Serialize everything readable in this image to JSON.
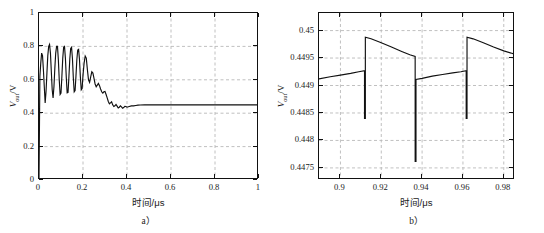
{
  "figure": {
    "panels": [
      {
        "id": "a",
        "caption": "a）",
        "axis_title_x": "时间/μs",
        "axis_title_y_main": "V",
        "axis_title_y_sub": "out",
        "axis_title_y_unit": "/V"
      },
      {
        "id": "b",
        "caption": "b）",
        "axis_title_x": "时间/μs",
        "axis_title_y_main": "V",
        "axis_title_y_sub": "out",
        "axis_title_y_unit": "/V"
      }
    ]
  },
  "chart_data": [
    {
      "type": "line",
      "panel": "a",
      "title": "",
      "xlabel": "时间/μs",
      "ylabel": "V_out/V",
      "xlim": [
        0,
        1
      ],
      "ylim": [
        0,
        1
      ],
      "xticks": [
        0,
        0.2,
        0.4,
        0.6,
        0.8,
        1
      ],
      "xticklabels": [
        "0",
        "0.2",
        "0.4",
        "0.6",
        "0.8",
        "1"
      ],
      "yticks": [
        0,
        0.2,
        0.4,
        0.6,
        0.8,
        1
      ],
      "yticklabels": [
        "0",
        "0.2",
        "0.4",
        "0.6",
        "0.8",
        "1"
      ],
      "grid": true,
      "legend": null,
      "line_color": "#111111",
      "series": [
        {
          "name": "V_out transient",
          "x": [
            0.0,
            0.004,
            0.008,
            0.012,
            0.016,
            0.02,
            0.024,
            0.028,
            0.032,
            0.036,
            0.04,
            0.044,
            0.048,
            0.052,
            0.056,
            0.06,
            0.064,
            0.068,
            0.072,
            0.076,
            0.08,
            0.084,
            0.088,
            0.092,
            0.096,
            0.1,
            0.104,
            0.108,
            0.112,
            0.116,
            0.12,
            0.124,
            0.128,
            0.132,
            0.136,
            0.14,
            0.144,
            0.148,
            0.152,
            0.156,
            0.16,
            0.164,
            0.168,
            0.172,
            0.176,
            0.18,
            0.184,
            0.188,
            0.192,
            0.196,
            0.2,
            0.205,
            0.21,
            0.215,
            0.22,
            0.225,
            0.23,
            0.235,
            0.24,
            0.245,
            0.25,
            0.255,
            0.26,
            0.265,
            0.27,
            0.275,
            0.28,
            0.285,
            0.29,
            0.295,
            0.3,
            0.305,
            0.31,
            0.315,
            0.32,
            0.325,
            0.33,
            0.335,
            0.34,
            0.345,
            0.35,
            0.355,
            0.36,
            0.365,
            0.37,
            0.375,
            0.38,
            0.385,
            0.39,
            0.395,
            0.4,
            0.41,
            0.42,
            0.43,
            0.44,
            0.45,
            0.46,
            0.48,
            0.5,
            0.55,
            0.6,
            0.7,
            0.8,
            0.9,
            1.0
          ],
          "y": [
            0.0,
            0.62,
            0.7,
            0.76,
            0.745,
            0.66,
            0.56,
            0.462,
            0.53,
            0.64,
            0.745,
            0.8,
            0.812,
            0.76,
            0.65,
            0.54,
            0.492,
            0.56,
            0.67,
            0.76,
            0.8,
            0.8,
            0.72,
            0.6,
            0.512,
            0.52,
            0.62,
            0.73,
            0.795,
            0.8,
            0.73,
            0.615,
            0.522,
            0.525,
            0.618,
            0.725,
            0.788,
            0.795,
            0.728,
            0.612,
            0.528,
            0.535,
            0.622,
            0.72,
            0.778,
            0.782,
            0.722,
            0.618,
            0.54,
            0.548,
            0.628,
            0.7,
            0.742,
            0.73,
            0.66,
            0.6,
            0.585,
            0.618,
            0.648,
            0.64,
            0.608,
            0.575,
            0.558,
            0.568,
            0.578,
            0.565,
            0.545,
            0.528,
            0.52,
            0.528,
            0.53,
            0.512,
            0.492,
            0.47,
            0.456,
            0.462,
            0.468,
            0.45,
            0.44,
            0.444,
            0.452,
            0.442,
            0.432,
            0.436,
            0.444,
            0.438,
            0.43,
            0.434,
            0.441,
            0.44,
            0.436,
            0.44,
            0.444,
            0.444,
            0.446,
            0.448,
            0.449,
            0.45,
            0.45,
            0.45,
            0.45,
            0.45,
            0.45,
            0.45,
            0.45
          ]
        }
      ]
    },
    {
      "type": "line",
      "panel": "b",
      "title": "",
      "xlabel": "时间/μs",
      "ylabel": "V_out/V",
      "xlim": [
        0.8895,
        0.9855
      ],
      "ylim": [
        0.44728,
        0.45032
      ],
      "xticks": [
        0.9,
        0.92,
        0.94,
        0.96,
        0.98
      ],
      "xticklabels": [
        "0.9",
        "0.92",
        "0.94",
        "0.96",
        "0.98"
      ],
      "yticks": [
        0.4475,
        0.448,
        0.4485,
        0.449,
        0.4495,
        0.45
      ],
      "yticklabels": [
        "0.4475",
        "0.448",
        "0.4485",
        "0.449",
        "0.4495",
        "0.45"
      ],
      "grid": true,
      "legend": null,
      "line_color": "#111111",
      "series": [
        {
          "name": "V_out steady-state ripple",
          "x": [
            0.8895,
            0.895,
            0.9,
            0.905,
            0.909,
            0.9118,
            0.9118,
            0.9122,
            0.9122,
            0.915,
            0.92,
            0.925,
            0.93,
            0.934,
            0.9366,
            0.9366,
            0.937,
            0.937,
            0.94,
            0.945,
            0.95,
            0.955,
            0.959,
            0.9616,
            0.9616,
            0.962,
            0.962,
            0.965,
            0.97,
            0.975,
            0.98,
            0.9855
          ],
          "y": [
            0.44912,
            0.44916,
            0.44919,
            0.44922,
            0.44925,
            0.44927,
            0.4484,
            0.4484,
            0.44988,
            0.44985,
            0.44978,
            0.4497,
            0.44962,
            0.44956,
            0.44953,
            0.44762,
            0.44762,
            0.44911,
            0.44913,
            0.44917,
            0.4492,
            0.44923,
            0.44925,
            0.44927,
            0.4484,
            0.4484,
            0.44988,
            0.44985,
            0.44978,
            0.4497,
            0.44963,
            0.44957
          ]
        }
      ]
    }
  ]
}
